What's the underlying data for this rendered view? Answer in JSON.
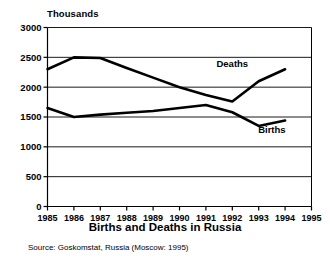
{
  "chart_data": {
    "type": "line",
    "title": "Births and Deaths in Russia",
    "source": "Source: Goskomstat, Russia (Moscow: 1995)",
    "unit_label": "Thousands",
    "xlabel": "",
    "ylabel": "Thousands",
    "grid": true,
    "legend_position": "inline-annotations",
    "xlim": [
      1985,
      1995
    ],
    "ylim": [
      0,
      3000
    ],
    "yticks": [
      0,
      500,
      1000,
      1500,
      2000,
      2500,
      3000
    ],
    "ytick_labels": [
      "0",
      "500",
      "1000",
      "1500",
      "2000",
      "2500",
      "3000"
    ],
    "xticks": [
      1985,
      1986,
      1987,
      1988,
      1989,
      1990,
      1991,
      1992,
      1993,
      1994,
      1995
    ],
    "xtick_labels": [
      "1985",
      "1986",
      "1987",
      "1988",
      "1989",
      "1990",
      "1991",
      "1992",
      "1993",
      "1994",
      "1995"
    ],
    "x": [
      1985,
      1986,
      1987,
      1988,
      1989,
      1990,
      1991,
      1992,
      1993,
      1994
    ],
    "series": [
      {
        "name": "Deaths",
        "color": "#000000",
        "values": [
          2300,
          2500,
          2490,
          2320,
          2160,
          2000,
          1870,
          1760,
          2100,
          2300
        ]
      },
      {
        "name": "Births",
        "color": "#000000",
        "values": [
          1650,
          1500,
          1540,
          1570,
          1600,
          1650,
          1700,
          1580,
          1350,
          1440
        ]
      }
    ],
    "annotations": [
      {
        "text": "Deaths",
        "x": 1992.0,
        "y": 2330
      },
      {
        "text": "Births",
        "x": 1993.5,
        "y": 1240
      }
    ]
  }
}
